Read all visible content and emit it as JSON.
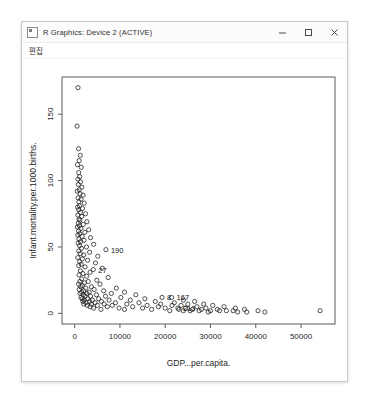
{
  "window": {
    "title": "R Graphics: Device 2 (ACTIVE)",
    "app_icon": "r-graphics-icon",
    "controls": {
      "minimize_label": "Minimize",
      "maximize_label": "Maximize",
      "close_label": "Close"
    }
  },
  "menubar": {
    "items": [
      {
        "label": "편집"
      }
    ]
  },
  "chart_data": {
    "type": "scatter",
    "title": "",
    "xlabel": "GDP...per.capita.",
    "ylabel": "Infant.mortality.per.1000.births.",
    "xlim": [
      -2800,
      57500
    ],
    "ylim": [
      -8,
      178
    ],
    "xticks": [
      0,
      10000,
      20000,
      30000,
      40000,
      50000
    ],
    "xtick_labels": [
      "0",
      "10000",
      "20000",
      "30000",
      "40000",
      "50000"
    ],
    "yticks": [
      0,
      50,
      100,
      150
    ],
    "ytick_labels": [
      "0",
      "50",
      "100",
      "150"
    ],
    "grid": false,
    "legend": "none",
    "point_symbol": "open-circle",
    "point_color": "#1a1a1a",
    "annotations": [
      {
        "label": "190",
        "x": 6900,
        "y": 48
      },
      {
        "label": "27",
        "x": 4100,
        "y": 33
      },
      {
        "label": "8",
        "x": 19300,
        "y": 12
      },
      {
        "label": "167",
        "x": 21400,
        "y": 12
      },
      {
        "label": "213",
        "x": 22800,
        "y": 4
      }
    ],
    "points": [
      [
        730,
        170
      ],
      [
        530,
        141
      ],
      [
        860,
        124
      ],
      [
        1250,
        119
      ],
      [
        980,
        115
      ],
      [
        620,
        112
      ],
      [
        1450,
        110
      ],
      [
        900,
        106
      ],
      [
        1100,
        103
      ],
      [
        700,
        101
      ],
      [
        1300,
        99
      ],
      [
        820,
        97
      ],
      [
        1600,
        95
      ],
      [
        1000,
        93
      ],
      [
        560,
        92
      ],
      [
        1180,
        90
      ],
      [
        1850,
        89
      ],
      [
        760,
        87
      ],
      [
        1400,
        86
      ],
      [
        930,
        84
      ],
      [
        2100,
        83
      ],
      [
        1050,
        81
      ],
      [
        640,
        80
      ],
      [
        1720,
        79
      ],
      [
        880,
        78
      ],
      [
        1260,
        76
      ],
      [
        2400,
        75
      ],
      [
        700,
        74
      ],
      [
        1550,
        73
      ],
      [
        960,
        71
      ],
      [
        1130,
        70
      ],
      [
        2700,
        69
      ],
      [
        810,
        68
      ],
      [
        1900,
        67
      ],
      [
        1020,
        66
      ],
      [
        590,
        65
      ],
      [
        1380,
        64
      ],
      [
        3100,
        63
      ],
      [
        870,
        62
      ],
      [
        2250,
        61
      ],
      [
        1120,
        60
      ],
      [
        680,
        59
      ],
      [
        1640,
        58
      ],
      [
        3500,
        57
      ],
      [
        940,
        56
      ],
      [
        2050,
        55
      ],
      [
        1300,
        54
      ],
      [
        760,
        53
      ],
      [
        4200,
        52
      ],
      [
        1080,
        51
      ],
      [
        2600,
        50
      ],
      [
        1500,
        49
      ],
      [
        6900,
        48
      ],
      [
        890,
        47
      ],
      [
        3300,
        46
      ],
      [
        1220,
        45
      ],
      [
        2000,
        44
      ],
      [
        5100,
        43
      ],
      [
        700,
        42
      ],
      [
        1700,
        41
      ],
      [
        2850,
        40
      ],
      [
        1100,
        39
      ],
      [
        4600,
        38
      ],
      [
        1450,
        37
      ],
      [
        900,
        36
      ],
      [
        2300,
        35
      ],
      [
        6100,
        34
      ],
      [
        4100,
        33
      ],
      [
        1250,
        32
      ],
      [
        3400,
        31
      ],
      [
        1800,
        30
      ],
      [
        980,
        29
      ],
      [
        2650,
        28
      ],
      [
        7400,
        27
      ],
      [
        1550,
        26
      ],
      [
        4900,
        25
      ],
      [
        1150,
        24
      ],
      [
        3000,
        24
      ],
      [
        2150,
        23
      ],
      [
        860,
        22
      ],
      [
        5600,
        22
      ],
      [
        1700,
        21
      ],
      [
        3700,
        20
      ],
      [
        1300,
        20
      ],
      [
        2450,
        19
      ],
      [
        9200,
        19
      ],
      [
        1000,
        18
      ],
      [
        4300,
        18
      ],
      [
        2000,
        17
      ],
      [
        6400,
        17
      ],
      [
        1550,
        16
      ],
      [
        3200,
        16
      ],
      [
        11000,
        16
      ],
      [
        2700,
        15
      ],
      [
        1200,
        15
      ],
      [
        8100,
        15
      ],
      [
        4800,
        14
      ],
      [
        1900,
        14
      ],
      [
        13500,
        14
      ],
      [
        3500,
        13
      ],
      [
        2300,
        13
      ],
      [
        6800,
        13
      ],
      [
        1400,
        12
      ],
      [
        19300,
        12
      ],
      [
        21400,
        12
      ],
      [
        10200,
        12
      ],
      [
        5300,
        11
      ],
      [
        2900,
        11
      ],
      [
        1650,
        11
      ],
      [
        15500,
        11
      ],
      [
        7600,
        10
      ],
      [
        3900,
        10
      ],
      [
        24000,
        10
      ],
      [
        2100,
        10
      ],
      [
        12300,
        10
      ],
      [
        5900,
        9
      ],
      [
        1800,
        9
      ],
      [
        17800,
        9
      ],
      [
        3300,
        9
      ],
      [
        26500,
        9
      ],
      [
        9000,
        8
      ],
      [
        2500,
        8
      ],
      [
        14200,
        8
      ],
      [
        4500,
        8
      ],
      [
        22000,
        8
      ],
      [
        6500,
        7
      ],
      [
        2000,
        7
      ],
      [
        28500,
        7
      ],
      [
        11500,
        7
      ],
      [
        3700,
        7
      ],
      [
        19000,
        7
      ],
      [
        25000,
        7
      ],
      [
        8300,
        6
      ],
      [
        2800,
        6
      ],
      [
        16000,
        6
      ],
      [
        5000,
        6
      ],
      [
        30500,
        6
      ],
      [
        21500,
        6
      ],
      [
        23500,
        6
      ],
      [
        12800,
        5
      ],
      [
        3400,
        5
      ],
      [
        27000,
        5
      ],
      [
        7200,
        5
      ],
      [
        18500,
        5
      ],
      [
        33000,
        5
      ],
      [
        22800,
        4
      ],
      [
        9800,
        4
      ],
      [
        4200,
        4
      ],
      [
        29000,
        4
      ],
      [
        24500,
        4
      ],
      [
        15000,
        4
      ],
      [
        35500,
        4
      ],
      [
        20000,
        4
      ],
      [
        26000,
        3
      ],
      [
        11000,
        3
      ],
      [
        31500,
        3
      ],
      [
        5800,
        3
      ],
      [
        23000,
        3
      ],
      [
        28000,
        3
      ],
      [
        17000,
        3
      ],
      [
        37500,
        3
      ],
      [
        25500,
        2
      ],
      [
        21000,
        2
      ],
      [
        33500,
        2
      ],
      [
        30000,
        2
      ],
      [
        27500,
        2
      ],
      [
        35000,
        2
      ],
      [
        40500,
        2
      ],
      [
        24000,
        2
      ],
      [
        32000,
        2
      ],
      [
        38000,
        1
      ],
      [
        29500,
        1
      ],
      [
        36000,
        1
      ],
      [
        54200,
        2
      ],
      [
        42000,
        1
      ]
    ]
  }
}
